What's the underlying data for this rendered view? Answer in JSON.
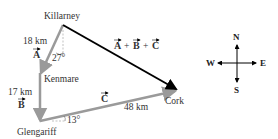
{
  "places": {
    "killarney": "Killarney",
    "kenmare": "Kenmare",
    "glengariff": "Glengariff",
    "cork": "Cork"
  },
  "vectors": {
    "a": {
      "symbol": "A",
      "distance": "18 km",
      "angle": "27°"
    },
    "b": {
      "symbol": "B",
      "distance": "17 km"
    },
    "c": {
      "symbol": "C",
      "distance": "48 km",
      "angle": "13°"
    },
    "resultant": {
      "label": "A + B + C",
      "parts": [
        "A",
        "+",
        "B",
        "+",
        "C"
      ]
    }
  },
  "compass": {
    "north": "N",
    "south": "S",
    "east": "E",
    "west": "W"
  },
  "colors": {
    "component_vector": "#9a9a9a",
    "resultant_vector": "#000000",
    "text": "#333333"
  }
}
